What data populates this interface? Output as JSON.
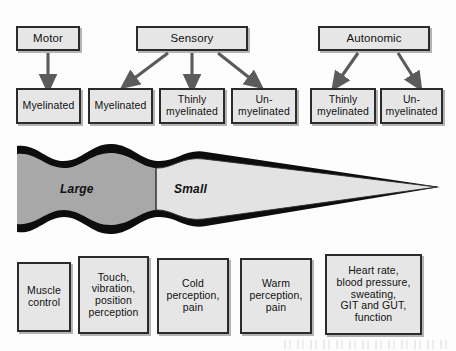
{
  "diagram": {
    "colors": {
      "box_fill": "#e6e6e6",
      "box_border": "#2b2b2b",
      "myelin_black": "#0d0d0d",
      "large_fiber_gray": "#a8a8a8",
      "small_fiber_gray": "#e3e3e3",
      "arrow": "#555555",
      "page_background": "#fdfdfd"
    },
    "tier1": {
      "label": "nerve-type",
      "boxes": [
        {
          "id": "motor",
          "text": "Motor"
        },
        {
          "id": "sensory",
          "text": "Sensory"
        },
        {
          "id": "autonomic",
          "text": "Autonomic"
        }
      ]
    },
    "tier2": {
      "label": "myelination",
      "boxes": [
        {
          "id": "motor-myelinated",
          "text": "Myelinated"
        },
        {
          "id": "sensory-myelinated",
          "text": "Myelinated"
        },
        {
          "id": "sensory-thinly-myelinated",
          "text": "Thinly\nmyelinated"
        },
        {
          "id": "sensory-unmyelinated",
          "text": "Un-\nmyelinated"
        },
        {
          "id": "autonomic-thinly-myelinated",
          "text": "Thinly\nmyelinated"
        },
        {
          "id": "autonomic-unmyelinated",
          "text": "Un-\nmyelinated"
        }
      ]
    },
    "wedge": {
      "label": "fiber-diameter-gradient",
      "large_label": "Large",
      "small_label": "Small"
    },
    "tier3": {
      "label": "function",
      "boxes": [
        {
          "id": "muscle-control",
          "text": "Muscle\ncontrol"
        },
        {
          "id": "touch-vibration",
          "text": "Touch,\nvibration,\nposition\nperception"
        },
        {
          "id": "cold-perception",
          "text": "Cold\nperception,\npain"
        },
        {
          "id": "warm-perception",
          "text": "Warm\nperception,\npain"
        },
        {
          "id": "autonomic-functions",
          "text": "Heart rate,\nblood pressure,\nsweating,\nGIT and GUT,\nfunction"
        }
      ]
    },
    "connectors": {
      "motor_to_myelinated": "arrow-down",
      "sensory_to_myelinated": "arrow-diagonal-left",
      "sensory_to_thinly": "arrow-down",
      "sensory_to_unmyelinated": "arrow-diagonal-right",
      "autonomic_to_thinly": "arrow-diagonal-left",
      "autonomic_to_unmyelinated": "arrow-diagonal-right"
    }
  }
}
